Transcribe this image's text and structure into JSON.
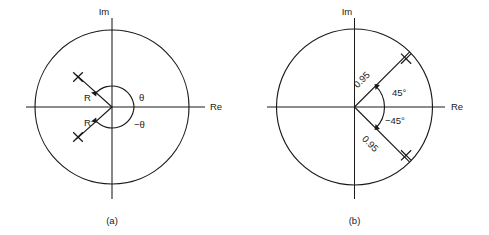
{
  "figure": {
    "width": 489,
    "height": 235,
    "background": "#ffffff",
    "ink_color": "#1a1a1a"
  },
  "panels": [
    {
      "caption": "(a)",
      "axis_labels": {
        "imaginary": "Im",
        "real": "Re"
      },
      "circle": {
        "label": "unit circle",
        "center_x": 112,
        "center_y": 107,
        "radius": 77
      },
      "poles": [
        {
          "marker": "x",
          "radius_label": "R",
          "angle_label": "θ",
          "angle_deg": 138,
          "radius_px": 45
        },
        {
          "marker": "x",
          "radius_label": "R",
          "angle_label": "−θ",
          "angle_deg": -138,
          "radius_px": 45
        }
      ],
      "annotations": {
        "radius_upper": "R",
        "radius_lower": "R",
        "angle_upper": "θ",
        "angle_lower": "−θ"
      }
    },
    {
      "caption": "(b)",
      "axis_labels": {
        "imaginary": "Im",
        "real": "Re"
      },
      "circle": {
        "label": "unit circle",
        "center_x": 109.5,
        "center_y": 107,
        "radius": 78
      },
      "poles": [
        {
          "marker": "x",
          "radius_label": "0.95",
          "angle_label": "45°",
          "angle_deg": 45,
          "radius_px": 74
        },
        {
          "marker": "x",
          "radius_label": "0.95",
          "angle_label": "−45°",
          "angle_deg": -45,
          "radius_px": 74
        }
      ],
      "annotations": {
        "radius_upper": "0.95",
        "radius_lower": "0.95",
        "angle_upper": "45°",
        "angle_lower": "−45°"
      }
    }
  ]
}
